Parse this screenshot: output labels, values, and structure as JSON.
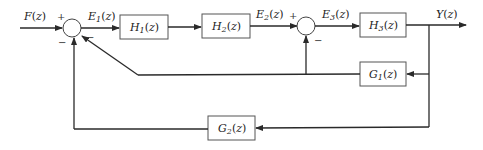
{
  "diagram": {
    "type": "block-diagram",
    "signals": {
      "input": "F(z)",
      "e1": "E1(z)",
      "e2": "E2(z)",
      "e3": "E3(z)",
      "output": "Y(z)"
    },
    "blocks": {
      "h1": "H1(z)",
      "h2": "H2(z)",
      "h3": "H3(z)",
      "g1": "G1(z)",
      "g2": "G2(z)"
    },
    "summers": {
      "s1": {
        "signs": [
          "+",
          "−",
          "−"
        ]
      },
      "s2": {
        "signs": [
          "+",
          "−"
        ]
      }
    },
    "labels": {
      "F": "F",
      "E": "E",
      "H": "H",
      "G": "G",
      "Y": "Y",
      "z": "(z)",
      "sub1": "1",
      "sub2": "2",
      "sub3": "3"
    }
  }
}
